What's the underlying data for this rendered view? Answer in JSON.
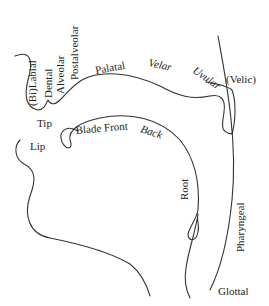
{
  "diagram": {
    "type": "vocal-tract-places-of-articulation",
    "upper_articulators": {
      "labels": [
        "(Bi)Labial",
        "Dental",
        "Alveolar",
        "Postalveolar",
        "Palatal",
        "Velar",
        "Uvular",
        "(Velic)"
      ]
    },
    "lower_articulators": {
      "labels": [
        "Tip",
        "Lip",
        "Blade",
        "Front",
        "Back",
        "Root"
      ]
    },
    "throat": {
      "labels": [
        "Pharyngeal",
        "Glottal"
      ]
    },
    "line_color": "#333333",
    "text_color": "#222222"
  },
  "labels": {
    "bilabial": "(Bi)Labial",
    "dental": "Dental",
    "alveolar": "Alveolar",
    "postalveolar": "Postalveolar",
    "palatal": "Palatal",
    "velar": "Velar",
    "uvular": "Uvular",
    "velic": "(Velic)",
    "tip": "Tip",
    "lip": "Lip",
    "blade_front": "Blade Front",
    "back": "Back",
    "root": "Root",
    "pharyngeal": "Pharyngeal",
    "glottal": "Glottal"
  }
}
